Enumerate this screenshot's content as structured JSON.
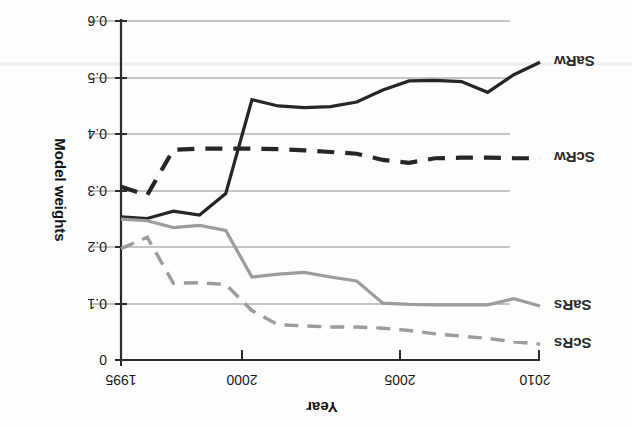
{
  "chart_data": {
    "type": "line",
    "title": "",
    "xlabel": "Year",
    "ylabel": "Model weights",
    "xlim": [
      1995,
      2011
    ],
    "ylim": [
      0,
      0.6
    ],
    "y_inverted_on_page": true,
    "rotation_degrees": 180,
    "grid": "horizontal",
    "legend_position": "inline-left-of-series",
    "xticks": [
      1995,
      2000,
      2005,
      2010
    ],
    "xtick_labels": [
      "1995",
      "2000",
      "2005",
      "2010"
    ],
    "yticks": [
      0,
      0.1,
      0.2,
      0.3,
      0.4,
      0.5,
      0.6
    ],
    "ytick_labels": [
      "0",
      "0.1",
      "0.2",
      "0.3",
      "0.4",
      "0.5",
      "0.6"
    ],
    "x": [
      1995,
      1996,
      1997,
      1998,
      1999,
      2000,
      2001,
      2002,
      2003,
      2004,
      2005,
      2006,
      2007,
      2008,
      2009,
      2010,
      2011
    ],
    "series": [
      {
        "name": "SaRw",
        "style": "solid",
        "color": "#262626",
        "width": 3.2,
        "values": [
          0.252,
          0.249,
          0.262,
          0.255,
          0.293,
          0.458,
          0.447,
          0.444,
          0.446,
          0.454,
          0.475,
          0.491,
          0.492,
          0.49,
          0.471,
          0.502,
          0.524
        ]
      },
      {
        "name": "ScRw",
        "style": "dashed",
        "color": "#262626",
        "width": 4.2,
        "values": [
          0.305,
          0.29,
          0.37,
          0.372,
          0.372,
          0.372,
          0.371,
          0.369,
          0.366,
          0.363,
          0.352,
          0.347,
          0.355,
          0.356,
          0.356,
          0.355,
          0.355
        ]
      },
      {
        "name": "SaRs",
        "style": "solid",
        "color": "#9c9c9c",
        "width": 3.2,
        "values": [
          0.248,
          0.245,
          0.233,
          0.237,
          0.228,
          0.146,
          0.151,
          0.154,
          0.146,
          0.139,
          0.1,
          0.098,
          0.097,
          0.097,
          0.097,
          0.108,
          0.095
        ]
      },
      {
        "name": "ScRs",
        "style": "dashed",
        "color": "#9c9c9c",
        "width": 3.4,
        "values": [
          0.196,
          0.216,
          0.135,
          0.136,
          0.133,
          0.087,
          0.062,
          0.06,
          0.058,
          0.058,
          0.056,
          0.052,
          0.046,
          0.042,
          0.038,
          0.032,
          0.028
        ]
      }
    ],
    "series_labels": [
      {
        "name": "ScRs",
        "at_year": 2011,
        "at_value": 0.028
      },
      {
        "name": "SaRs",
        "at_year": 2011,
        "at_value": 0.095
      },
      {
        "name": "ScRw",
        "at_year": 2011,
        "at_value": 0.355
      },
      {
        "name": "SaRw",
        "at_year": 2011,
        "at_value": 0.524
      }
    ],
    "colors": {
      "dark": "#262626",
      "gray": "#9c9c9c",
      "axis": "#2b2b2b",
      "grid": "#8d8d8d",
      "background": "#fdfdfd"
    }
  }
}
